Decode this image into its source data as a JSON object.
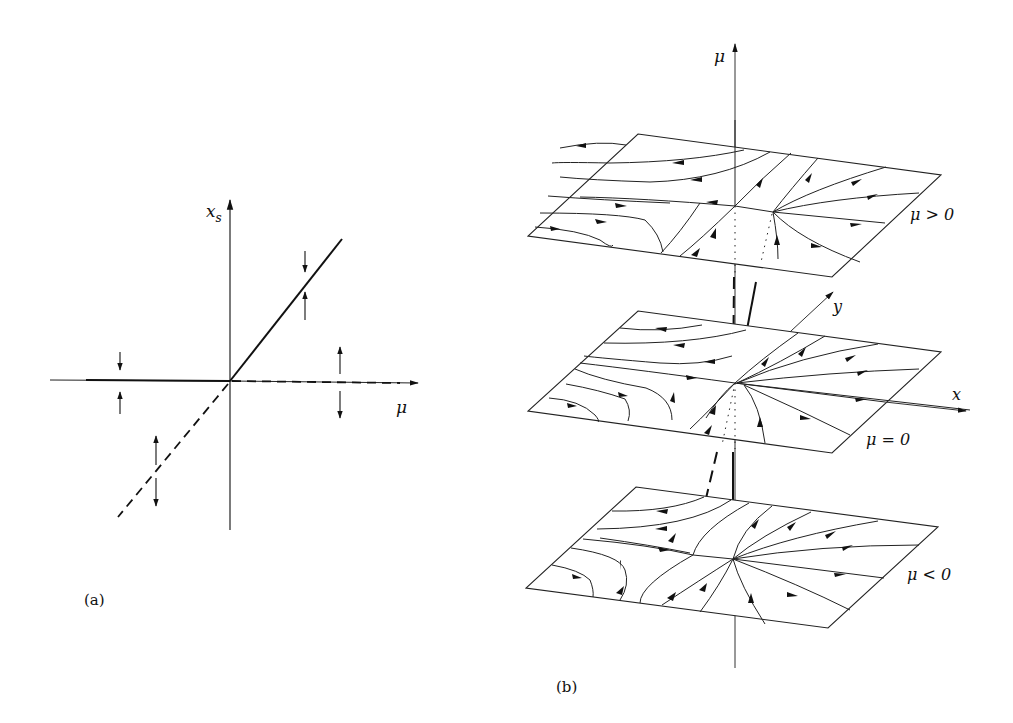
{
  "figure": {
    "panel_a": {
      "caption": "(a)",
      "y_axis_label": "x",
      "y_axis_subscript": "s",
      "x_axis_label": "μ",
      "branches": [
        {
          "name": "x_s = 0",
          "stable_for": "μ < 0",
          "unstable_for": "μ > 0"
        },
        {
          "name": "x_s = μ",
          "stable_for": "μ > 0",
          "unstable_for": "μ < 0"
        }
      ]
    },
    "panel_b": {
      "caption": "(b)",
      "vertical_axis_label": "μ",
      "x_axis_label": "x",
      "y_axis_label": "y",
      "planes": [
        {
          "label": "μ > 0"
        },
        {
          "label": "μ = 0"
        },
        {
          "label": "μ < 0"
        }
      ]
    }
  }
}
